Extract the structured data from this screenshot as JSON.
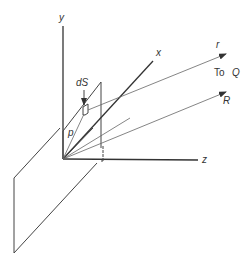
{
  "diagram": {
    "title": "",
    "axes": {
      "x_label": "x",
      "y_label": "y",
      "z_label": "z"
    },
    "labels": {
      "element": "dS",
      "rho": "p",
      "r": "r",
      "R": "R",
      "to_q_prefix": "To",
      "to_q_point": "Q"
    },
    "colors": {
      "line": "#444444",
      "background": "#ffffff"
    }
  }
}
